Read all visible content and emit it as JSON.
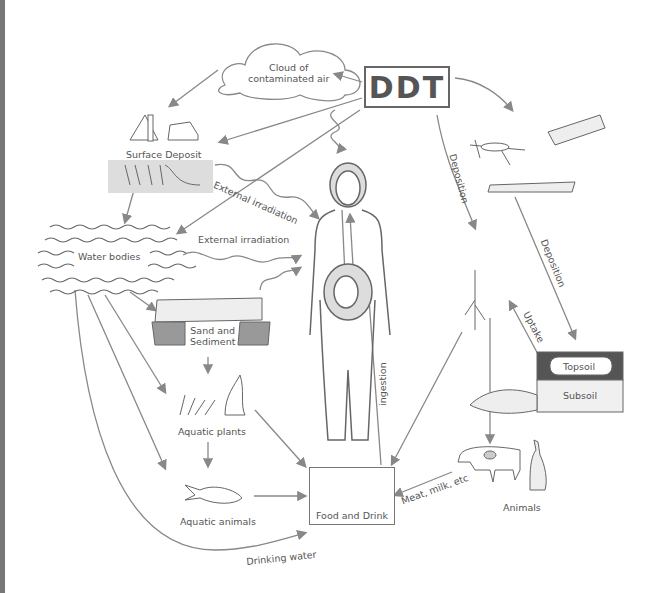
{
  "title": "DDT",
  "nodes": {
    "ddt": {
      "label": "DDT"
    },
    "cloud": {
      "label_line1": "Cloud of",
      "label_line2": "contaminated air"
    },
    "surface_deposit": {
      "label": "Surface Deposit"
    },
    "water_bodies": {
      "label": "Water bodies"
    },
    "sand_sediment": {
      "label_line1": "Sand and",
      "label_line2": "Sediment"
    },
    "aquatic_plants": {
      "label": "Aquatic plants"
    },
    "aquatic_animals": {
      "label": "Aquatic animals"
    },
    "food_drink": {
      "label": "Food and Drink"
    },
    "topsoil": {
      "label": "Topsoil"
    },
    "subsoil": {
      "label": "Subsoil"
    },
    "animals": {
      "label": "Animals"
    },
    "human": {
      "label": "Woman with fetus"
    }
  },
  "edges": {
    "external_irradiation_1": "External irradiation",
    "external_irradiation_2": "External irradiation",
    "deposition_1": "Deposition",
    "deposition_2": "Deposition",
    "uptake": "Uptake",
    "ingestion": "ingestion",
    "meat_milk": "Meat, milk, etc",
    "drinking_water": "Drinking water"
  },
  "colors": {
    "line": "#888888",
    "text": "#555555",
    "edge_strip": "#777777",
    "fill": "#e6e6e6"
  }
}
